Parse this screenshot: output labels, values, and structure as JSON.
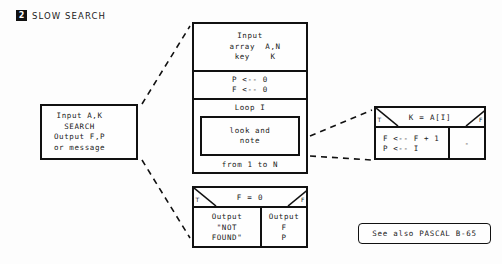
{
  "title": {
    "badge": "2",
    "text": "SLOW SEARCH"
  },
  "summary_box": {
    "name": "summary",
    "lines": "Input A,K\nSEARCH\nOutput F,P\nor message"
  },
  "main_structure": {
    "input_block": "Input\n  array  A,N\n  key    K",
    "init_block": "P <-- 0\nF <-- 0",
    "loop_header": "Loop I",
    "loop_body": "look and\nnote",
    "loop_footer": "from 1 to N"
  },
  "inner_decision": {
    "condition": "K = A[I]",
    "true_label": "T",
    "false_label": "F",
    "true_branch": "F <-- F + 1\nP <-- I",
    "false_branch": "-"
  },
  "output_decision": {
    "condition": "F = 0",
    "true_label": "T",
    "false_label": "F",
    "true_branch": "Output\n\"NOT\nFOUND\"",
    "false_branch": "Output\nF\nP"
  },
  "footer": {
    "note": "See also PASCAL B-65"
  },
  "colors": {
    "ink": "#111111",
    "paper": "#fdfdfd",
    "badge_bg": "#111111",
    "badge_fg": "#ffffff"
  }
}
